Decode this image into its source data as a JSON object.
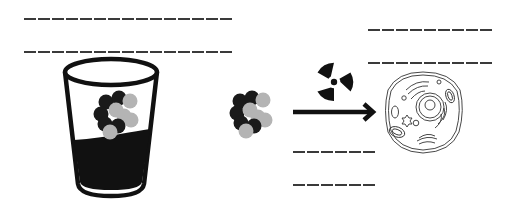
{
  "diagram": {
    "title": "",
    "colors": {
      "ink": "#111111",
      "dark_atom": "#1a1a1a",
      "light_atom": "#b4b4b4",
      "blank_line": "#3a3a3a",
      "background": "#ffffff"
    },
    "blanks": {
      "top_left": [
        "",
        ""
      ],
      "top_right": [
        "",
        ""
      ],
      "bottom_middle": [
        "",
        ""
      ]
    },
    "elements": [
      {
        "id": "glass",
        "icon": "glass-with-liquid-icon",
        "contents": "molecule-cluster"
      },
      {
        "id": "molecule",
        "icon": "molecule-cluster-icon"
      },
      {
        "id": "radiation",
        "icon": "radiation-trefoil-icon"
      },
      {
        "id": "arrow",
        "icon": "arrow-right-icon"
      },
      {
        "id": "cell",
        "icon": "animal-cell-icon"
      }
    ]
  }
}
